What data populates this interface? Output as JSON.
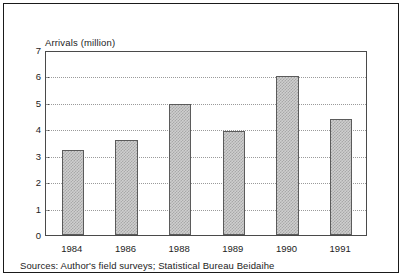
{
  "figure": {
    "source_note": "Sources: Author's field surveys; Statistical Bureau Beidaihe"
  },
  "chart_data": {
    "type": "bar",
    "title": "",
    "xlabel": "",
    "ylabel": "Arrivals (million)",
    "categories": [
      "1984",
      "1986",
      "1988",
      "1989",
      "1990",
      "1991"
    ],
    "values": [
      3.2,
      3.6,
      4.95,
      3.95,
      6.0,
      4.4
    ],
    "ylim": [
      0,
      7
    ],
    "ytick_labels": [
      "0",
      "1",
      "2",
      "3",
      "4",
      "5",
      "6",
      "7"
    ],
    "ytick_values": [
      0,
      1,
      2,
      3,
      4,
      5,
      6,
      7
    ],
    "grid": "horizontal-dotted",
    "legend": "none",
    "bar_fill_color": "#cfcfcf",
    "bar_edge_color": "#5b5b5b",
    "gridline_color": "#9a9a9a",
    "axis_color": "#4a4a4a",
    "frame_color": "#1a1a1a"
  }
}
